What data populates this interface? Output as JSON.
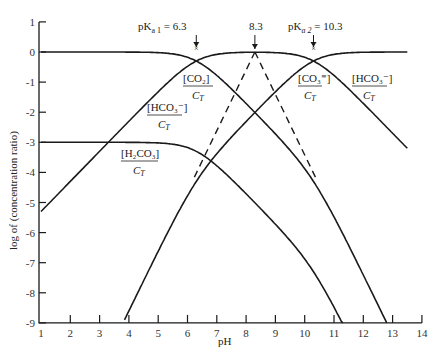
{
  "chart_data": {
    "type": "line",
    "title": "",
    "xlabel": "pH",
    "ylabel": "log of (concentration ratio)",
    "xlim": [
      1,
      14
    ],
    "ylim": [
      -9,
      1
    ],
    "x_ticks": [
      "1",
      "2",
      "3",
      "4",
      "5",
      "6",
      "7",
      "8",
      "9",
      "10",
      "11",
      "12",
      "13",
      "14"
    ],
    "y_ticks": [
      "1",
      "0",
      "-1",
      "-2",
      "-3",
      "-4",
      "-5",
      "-6",
      "-7",
      "-8",
      "-9"
    ],
    "grid": false,
    "pKa1": 6.3,
    "pKa2": 10.3,
    "series": [
      {
        "name": "[CO2]/C_T",
        "x": [
          1,
          4,
          5,
          6,
          6.3,
          7,
          8,
          9,
          10,
          11,
          11.3
        ],
        "values": [
          0,
          -0.001,
          -0.02,
          -0.18,
          -0.3,
          -0.78,
          -1.71,
          -2.7,
          -3.85,
          -5.4,
          -9
        ]
      },
      {
        "name": "[HCO3-]/C_T",
        "x": [
          1,
          2,
          3,
          4,
          5,
          6,
          6.3,
          7,
          8,
          8.3,
          9,
          10,
          10.3,
          11,
          12,
          13,
          13.5
        ],
        "values": [
          -5.3,
          -4.3,
          -3.3,
          -2.3,
          -1.32,
          -0.48,
          -0.3,
          -0.08,
          -0.01,
          0,
          -0.02,
          -0.18,
          -0.3,
          -0.78,
          -1.71,
          -2.7,
          -3.2
        ]
      },
      {
        "name": "[CO3=]/C_T",
        "x": [
          3.8,
          5,
          6,
          6.3,
          7,
          8,
          9,
          10,
          10.3,
          11,
          12,
          13,
          13.5
        ],
        "values": [
          -9,
          -6.6,
          -4.8,
          -4.3,
          -3.0,
          -2.3,
          -1.32,
          -0.48,
          -0.3,
          -0.08,
          -0.01,
          0,
          0
        ]
      },
      {
        "name": "[H2CO3]/C_T",
        "x": [
          1,
          4,
          5,
          6,
          7,
          8,
          9,
          10,
          11,
          12.8
        ],
        "values": [
          -3,
          -3,
          -3.02,
          -3.18,
          -3.78,
          -4.71,
          -5.7,
          -6.85,
          -8.2,
          -9
        ]
      }
    ],
    "annotations": [
      {
        "text": "pK_a1 = 6.3",
        "x": 6.3,
        "marker": "×",
        "y": 0
      },
      {
        "text": "8.3",
        "x": 8.3,
        "y": 0
      },
      {
        "text": "pK_a2 = 10.3",
        "x": 10.3,
        "marker": "×",
        "y": 0
      },
      {
        "text": "dashed lines from (8.3, 0) to (6.3, -4.3) and (10.3, -4.3)"
      }
    ]
  },
  "labels": {
    "pka1": "pK",
    "pka1_sub": "a 1",
    "pka1_val": " = 6.3",
    "mid": "8.3",
    "pka2": "pK",
    "pka2_sub": "a 2",
    "pka2_val": " = 10.3",
    "co2_num": "[CO₂]",
    "co3_num": "[CO₃⁼]",
    "hco3_left_num": "[HCO₃⁻]",
    "hco3_right_num": "[HCO₃⁻]",
    "h2co3_num": "[H₂CO₃]",
    "den": "C",
    "den_sub": "T",
    "xlabel": "pH",
    "ylabel": "log of (concentration ratio)"
  }
}
